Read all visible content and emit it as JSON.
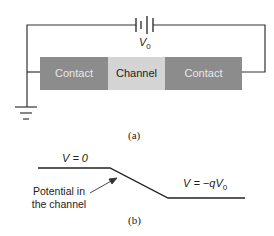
{
  "panel_a": {
    "caption": "(a)",
    "battery_label": "V",
    "battery_sub": "0",
    "segments": [
      {
        "label": "Contact",
        "color": "#8c8c8c",
        "text_color": "#e8e8e8"
      },
      {
        "label": "Channel",
        "color": "#d4d4d4",
        "text_color": "#222222"
      },
      {
        "label": "Contact",
        "color": "#8c8c8c",
        "text_color": "#e8e8e8"
      }
    ]
  },
  "panel_b": {
    "caption": "(b)",
    "left_level_label": "V = 0",
    "right_level_label_prefix": "V = −qV",
    "right_level_label_sub": "0",
    "annotation_line1": "Potential in",
    "annotation_line2": "the channel"
  }
}
